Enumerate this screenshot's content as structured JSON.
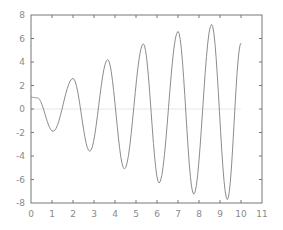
{
  "chart_data": {
    "type": "line",
    "title": "",
    "xlabel": "",
    "ylabel": "",
    "xlim": [
      0,
      11
    ],
    "ylim": [
      -8,
      8
    ],
    "grid": false,
    "legend": null,
    "x_ticks": [
      "0",
      "1",
      "2",
      "3",
      "4",
      "5",
      "6",
      "7",
      "8",
      "9",
      "10",
      "11"
    ],
    "y_ticks": [
      "8",
      "6",
      "4",
      "2",
      "0",
      "-2",
      "-4",
      "-6",
      "-8"
    ],
    "series": [
      {
        "name": "oscillation",
        "color": "#8c8c8c",
        "keypoints": {
          "x": [
            0,
            0.3,
            1.05,
            2.0,
            2.8,
            3.65,
            4.45,
            5.35,
            6.1,
            7.0,
            7.75,
            8.6,
            9.35,
            10.0
          ],
          "y": [
            1.0,
            0.95,
            -1.9,
            2.6,
            -3.6,
            4.2,
            -5.1,
            5.55,
            -6.3,
            6.6,
            -7.25,
            7.2,
            -7.7,
            5.6
          ]
        }
      },
      {
        "name": "zero-line",
        "color": "#e6e6e6",
        "keypoints": {
          "x": [
            0,
            10
          ],
          "y": [
            0,
            0
          ]
        }
      }
    ]
  },
  "frame": {
    "color": "#777777",
    "tick_label_color": "#8a8a8a"
  }
}
